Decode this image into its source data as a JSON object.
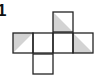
{
  "figure": {
    "label": "1",
    "type": "cube-net",
    "cell_size": 20,
    "line_color": "#222222",
    "shade_color": "#d3d3d3",
    "cells": [
      {
        "id": "top",
        "x": 53,
        "y": 12,
        "shade": "lower-left"
      },
      {
        "id": "mid-1",
        "x": 13,
        "y": 33,
        "shade": "upper-left"
      },
      {
        "id": "mid-2",
        "x": 33,
        "y": 33,
        "shade": "none"
      },
      {
        "id": "mid-3",
        "x": 53,
        "y": 33,
        "shade": "none"
      },
      {
        "id": "mid-4",
        "x": 73,
        "y": 33,
        "shade": "lower-left"
      },
      {
        "id": "bottom",
        "x": 33,
        "y": 54,
        "shade": "none"
      }
    ]
  }
}
